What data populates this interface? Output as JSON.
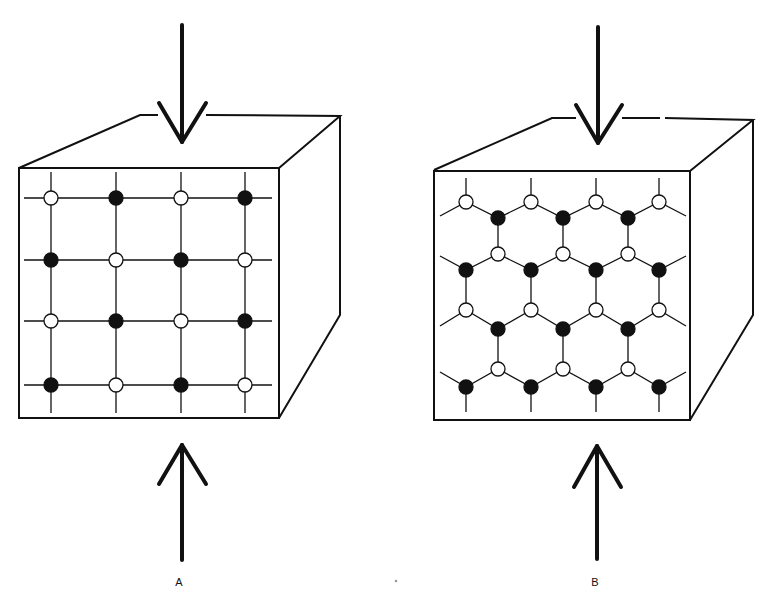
{
  "figure": {
    "panels": [
      {
        "id": "A",
        "label": "A",
        "lattice": "square",
        "description": "Cube with square lattice of alternating filled and open atoms on front face, compressed by opposing vertical arrows",
        "rows": [
          [
            "open",
            "filled",
            "open",
            "filled"
          ],
          [
            "filled",
            "open",
            "filled",
            "open"
          ],
          [
            "open",
            "filled",
            "open",
            "filled"
          ],
          [
            "filled",
            "open",
            "filled",
            "open"
          ]
        ]
      },
      {
        "id": "B",
        "label": "B",
        "lattice": "hexagonal",
        "description": "Cube with hexagonal (honeycomb) lattice of alternating filled and open atoms on front face, compressed by opposing vertical arrows",
        "rows": [
          [
            "open",
            "open",
            "open",
            "open"
          ],
          [
            "filled",
            "filled",
            "filled"
          ],
          [
            "open",
            "open",
            "open"
          ],
          [
            "filled",
            "filled",
            "filled",
            "filled"
          ],
          [
            "open",
            "open",
            "open",
            "open"
          ],
          [
            "filled",
            "filled",
            "filled"
          ],
          [
            "open",
            "open",
            "open"
          ],
          [
            "filled",
            "filled",
            "filled",
            "filled"
          ]
        ]
      }
    ],
    "colors": {
      "ink": "#111111",
      "background": "#ffffff",
      "open_atom_fill": "#ffffff",
      "filled_atom_fill": "#111111"
    }
  }
}
